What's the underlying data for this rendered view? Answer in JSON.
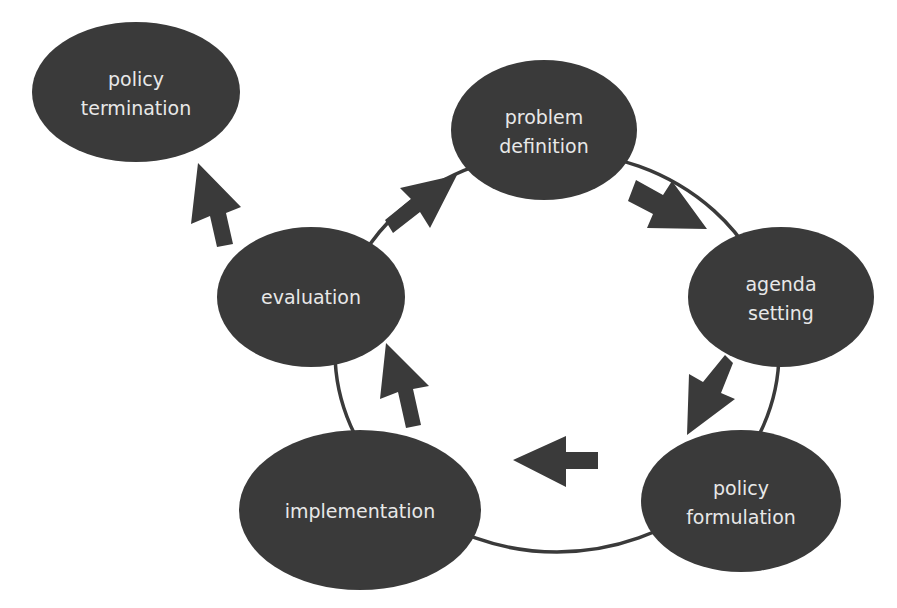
{
  "diagram": {
    "type": "cycle",
    "colors": {
      "node_fill": "#3a3a3a",
      "text": "#e8e8e8",
      "arrow": "#3a3a3a",
      "background": "#ffffff"
    },
    "nodes": [
      {
        "id": "policy-termination",
        "lines": [
          "policy",
          "termination"
        ]
      },
      {
        "id": "problem-definition",
        "lines": [
          "problem",
          "definition"
        ]
      },
      {
        "id": "agenda-setting",
        "lines": [
          "agenda",
          "setting"
        ]
      },
      {
        "id": "policy-formulation",
        "lines": [
          "policy",
          "formulation"
        ]
      },
      {
        "id": "implementation",
        "lines": [
          "implementation"
        ]
      },
      {
        "id": "evaluation",
        "lines": [
          "evaluation"
        ]
      }
    ],
    "edges": [
      {
        "from": "problem-definition",
        "to": "agenda-setting"
      },
      {
        "from": "agenda-setting",
        "to": "policy-formulation"
      },
      {
        "from": "policy-formulation",
        "to": "implementation"
      },
      {
        "from": "implementation",
        "to": "evaluation"
      },
      {
        "from": "evaluation",
        "to": "problem-definition"
      },
      {
        "from": "evaluation",
        "to": "policy-termination"
      }
    ]
  }
}
